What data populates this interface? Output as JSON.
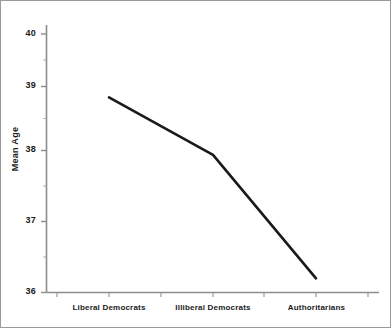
{
  "chart_data": {
    "type": "line",
    "title": "",
    "subtitle": "",
    "xlabel": "",
    "ylabel": "Mean Age",
    "categories": [
      "Liberal Democrats",
      "Illiberal Democrats",
      "Authoritarians"
    ],
    "values": [
      39.02,
      38.13,
      36.22
    ],
    "series": [
      {
        "name": "Mean Age",
        "values": [
          39.02,
          38.13,
          36.22
        ],
        "color": "#1a1a1a"
      }
    ],
    "ylim": [
      35.8,
      40.25
    ],
    "y_major_ticks": [
      36,
      37,
      38,
      39,
      40
    ],
    "y_major_tick_labels": [
      "36",
      "37",
      "38",
      "39",
      "40"
    ],
    "y_minor_ticks": [
      36.5,
      37.5,
      38.5,
      39.5
    ],
    "grid": false,
    "legend": false,
    "legend_position": "none",
    "line_width_px": 2.6,
    "axis_color": "#8c8c8c",
    "text_color": "#1a1a1a",
    "background_color": "#ffffff",
    "border_color": "#9a9a9a"
  },
  "axes": {
    "y_title": "Mean Age",
    "y_tick_labels": [
      "40",
      "39",
      "38",
      "37",
      "36"
    ],
    "x_tick_labels": [
      "Liberal Democrats",
      "Illiberal Democrats",
      "Authoritarians"
    ]
  }
}
